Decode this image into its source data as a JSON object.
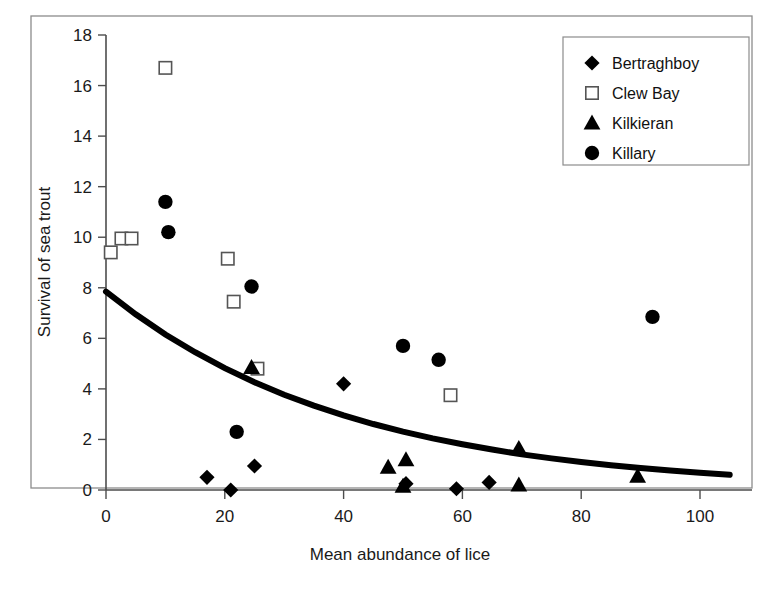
{
  "chart_data": {
    "type": "scatter",
    "title": "",
    "xlabel": "Mean abundance of lice",
    "ylabel": "Survival of sea trout",
    "xlim": [
      0,
      107
    ],
    "ylim": [
      0,
      18
    ],
    "xticks": [
      0,
      20,
      40,
      60,
      80,
      100
    ],
    "yticks": [
      0,
      2,
      4,
      6,
      8,
      10,
      12,
      14,
      16,
      18
    ],
    "grid": false,
    "legend_position": "top-right",
    "series": [
      {
        "name": "Bertraghboy",
        "marker": "filled-diamond",
        "color": "#000000",
        "points": [
          [
            17.0,
            0.5
          ],
          [
            21.0,
            0.0
          ],
          [
            25.0,
            0.95
          ],
          [
            40.0,
            4.2
          ],
          [
            50.5,
            0.25
          ],
          [
            59.0,
            0.05
          ],
          [
            64.5,
            0.3
          ]
        ]
      },
      {
        "name": "Clew Bay",
        "marker": "open-square",
        "color": "#ffffff",
        "points": [
          [
            0.8,
            9.4
          ],
          [
            2.6,
            9.95
          ],
          [
            4.3,
            9.95
          ],
          [
            10.0,
            16.7
          ],
          [
            20.5,
            9.15
          ],
          [
            21.5,
            7.45
          ],
          [
            25.5,
            4.8
          ],
          [
            58.0,
            3.75
          ]
        ]
      },
      {
        "name": "Kilkieran",
        "marker": "filled-triangle",
        "color": "#000000",
        "points": [
          [
            24.5,
            4.85
          ],
          [
            47.5,
            0.9
          ],
          [
            50.0,
            0.15
          ],
          [
            50.5,
            1.2
          ],
          [
            69.5,
            1.65
          ],
          [
            69.5,
            0.2
          ],
          [
            89.5,
            0.55
          ]
        ]
      },
      {
        "name": "Killary",
        "marker": "filled-circle",
        "color": "#000000",
        "points": [
          [
            10.0,
            11.4
          ],
          [
            10.5,
            10.2
          ],
          [
            24.5,
            8.05
          ],
          [
            22.0,
            2.3
          ],
          [
            50.0,
            5.7
          ],
          [
            56.0,
            5.15
          ],
          [
            92.0,
            6.85
          ]
        ]
      }
    ],
    "fit_curve": {
      "name": "exponential-decay-fit",
      "equation_form": "y = 7.85 * exp(-0.0245 * x)",
      "y_at_x0": 7.85,
      "y_at_x105": 0.6,
      "points": [
        [
          0,
          7.85
        ],
        [
          5,
          6.95
        ],
        [
          10,
          6.15
        ],
        [
          15,
          5.45
        ],
        [
          20,
          4.82
        ],
        [
          25,
          4.26
        ],
        [
          30,
          3.77
        ],
        [
          35,
          3.34
        ],
        [
          40,
          2.95
        ],
        [
          45,
          2.61
        ],
        [
          50,
          2.31
        ],
        [
          55,
          2.04
        ],
        [
          60,
          1.81
        ],
        [
          65,
          1.6
        ],
        [
          70,
          1.41
        ],
        [
          75,
          1.25
        ],
        [
          80,
          1.11
        ],
        [
          85,
          0.98
        ],
        [
          90,
          0.87
        ],
        [
          95,
          0.77
        ],
        [
          100,
          0.68
        ],
        [
          105,
          0.6
        ]
      ]
    }
  },
  "axes": {
    "ylabel": "Survival of sea trout",
    "xlabel": "Mean abundance of lice",
    "ytick_labels": [
      "0",
      "2",
      "4",
      "6",
      "8",
      "10",
      "12",
      "14",
      "16",
      "18"
    ],
    "xtick_labels": [
      "0",
      "20",
      "40",
      "60",
      "80",
      "100"
    ]
  },
  "legend": {
    "entries": [
      {
        "label": "Bertraghboy",
        "marker": "filled-diamond"
      },
      {
        "label": "Clew Bay",
        "marker": "open-square"
      },
      {
        "label": "Kilkieran",
        "marker": "filled-triangle"
      },
      {
        "label": "Killary",
        "marker": "filled-circle"
      }
    ]
  }
}
